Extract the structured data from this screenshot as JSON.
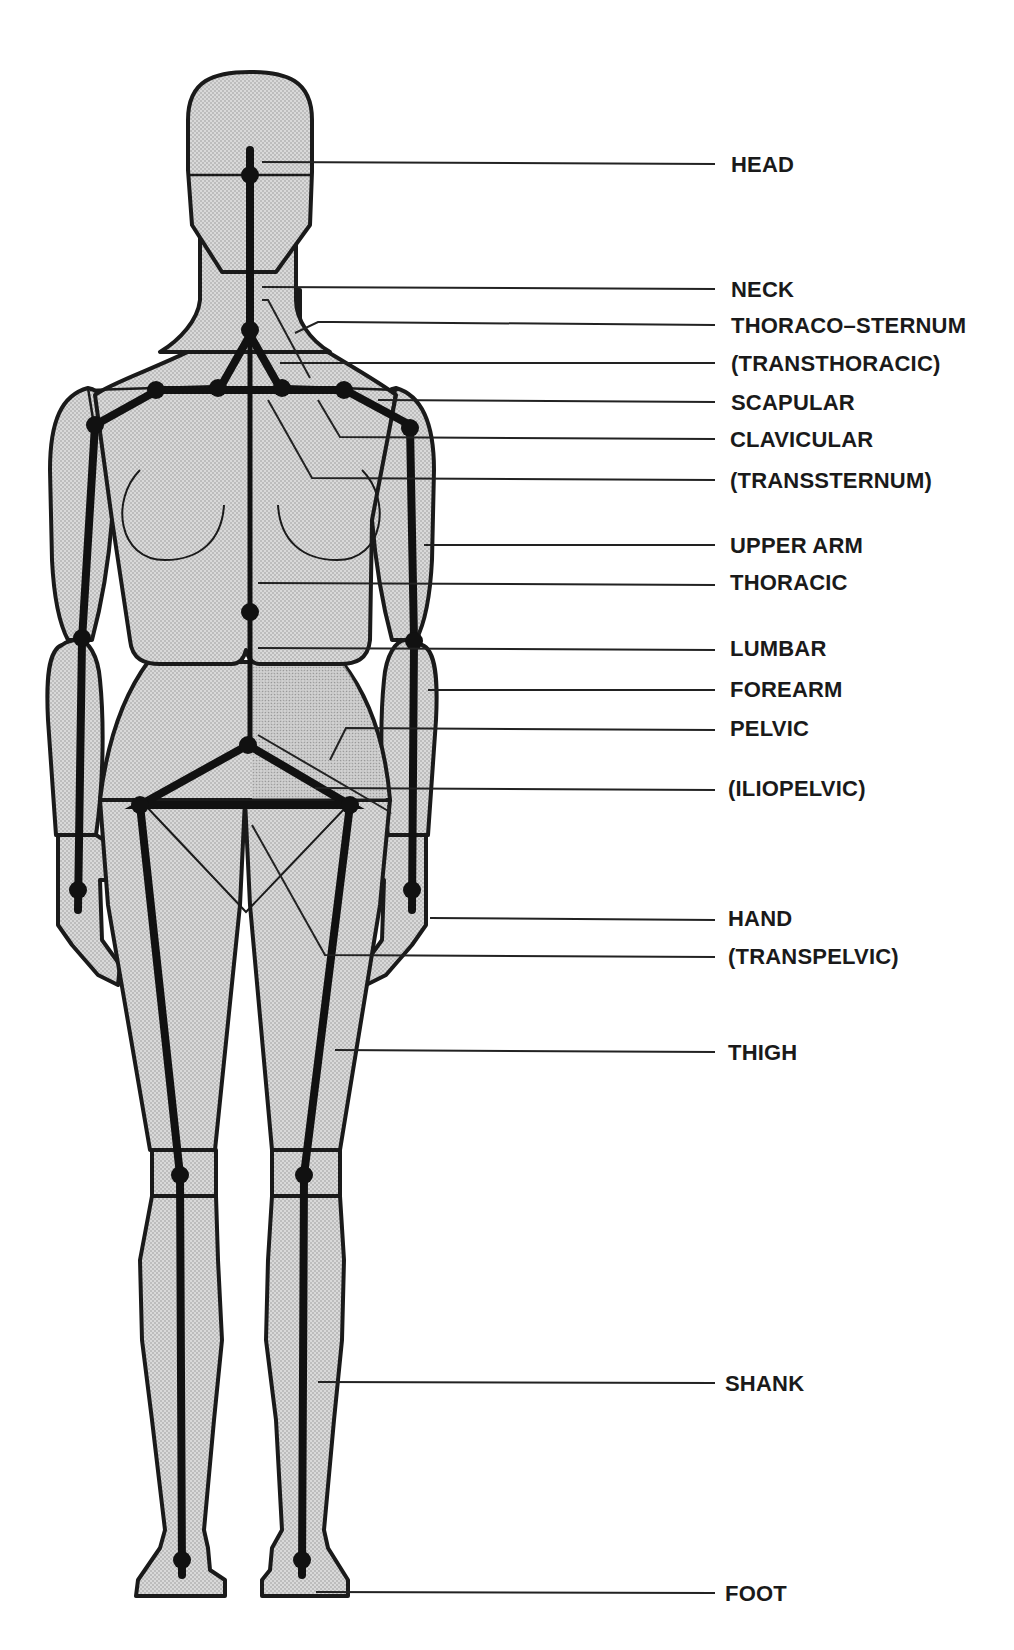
{
  "diagram": {
    "type": "anatomical-segment-diagram",
    "colors": {
      "fill": "#d4d4d4",
      "ink": "#1a1a1a",
      "background": "#ffffff"
    },
    "labels": [
      {
        "id": "head",
        "text": "HEAD"
      },
      {
        "id": "neck",
        "text": "NECK"
      },
      {
        "id": "thoraco_sternum",
        "text": "THORACO–STERNUM"
      },
      {
        "id": "transthoracic",
        "text": "(TRANSTHORACIC)"
      },
      {
        "id": "scapular",
        "text": "SCAPULAR"
      },
      {
        "id": "clavicular",
        "text": "CLAVICULAR"
      },
      {
        "id": "transsternum",
        "text": "(TRANSSTERNUM)"
      },
      {
        "id": "upper_arm",
        "text": "UPPER ARM"
      },
      {
        "id": "thoracic",
        "text": "THORACIC"
      },
      {
        "id": "lumbar",
        "text": "LUMBAR"
      },
      {
        "id": "forearm",
        "text": "FOREARM"
      },
      {
        "id": "pelvic",
        "text": "PELVIC"
      },
      {
        "id": "iliopelvic",
        "text": "(ILIOPELVIC)"
      },
      {
        "id": "hand",
        "text": "HAND"
      },
      {
        "id": "transpelvic",
        "text": "(TRANSPELVIC)"
      },
      {
        "id": "thigh",
        "text": "THIGH"
      },
      {
        "id": "shank",
        "text": "SHANK"
      },
      {
        "id": "foot",
        "text": "FOOT"
      }
    ]
  }
}
